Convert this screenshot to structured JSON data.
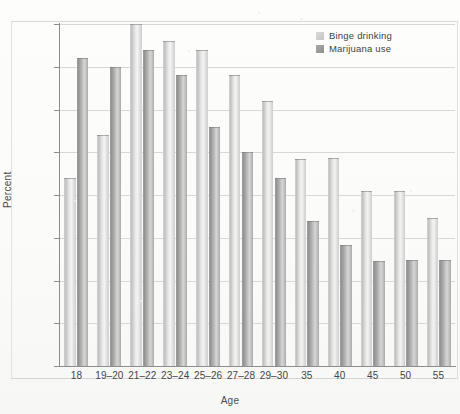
{
  "figure": {
    "y_axis_title": "Percent",
    "x_axis_title": "Age"
  },
  "legend": {
    "position": "top-right",
    "items": [
      {
        "label": "Binge drinking",
        "color": "#d5d5d5",
        "key": "binge"
      },
      {
        "label": "Marijuana use",
        "color": "#9a9a9a",
        "key": "marijuana"
      }
    ]
  },
  "axes": {
    "y_ticks": [
      "0",
      "5",
      "10",
      "15",
      "20",
      "25",
      "30",
      "35",
      "40"
    ],
    "x_ticks": [
      "18",
      "19–20",
      "21–22",
      "23–24",
      "25–26",
      "27–28",
      "29–30",
      "35",
      "40",
      "45",
      "50",
      "55"
    ]
  },
  "chart_data": {
    "type": "bar",
    "title": "",
    "xlabel": "Age",
    "ylabel": "Percent",
    "ylim": [
      0,
      40
    ],
    "ytick_step": 5,
    "grid": true,
    "legend_position": "top-right",
    "categories": [
      "18",
      "19–20",
      "21–22",
      "23–24",
      "25–26",
      "27–28",
      "29–30",
      "35",
      "40",
      "45",
      "50",
      "55"
    ],
    "series": [
      {
        "name": "Binge drinking",
        "color": "#d5d5d5",
        "values": [
          22,
          27,
          40,
          38,
          37,
          34,
          31,
          24.2,
          24.3,
          20.5,
          20.5,
          17.3
        ]
      },
      {
        "name": "Marijuana use",
        "color": "#9a9a9a",
        "values": [
          36,
          35,
          37,
          34,
          28,
          25,
          22,
          17,
          14.2,
          12.3,
          12.4,
          12.4
        ]
      }
    ]
  }
}
